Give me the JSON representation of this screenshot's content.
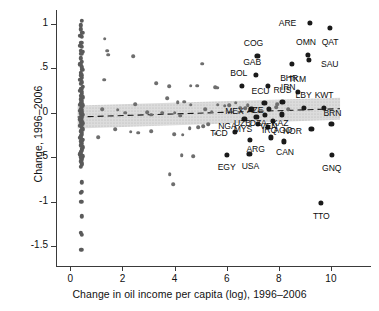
{
  "chart_data": {
    "type": "scatter",
    "title": "",
    "xlabel": "Change in oil income per capita (log), 1996–2006",
    "ylabel": "Change, 1996–2006",
    "xlim": [
      -0.55,
      11.5
    ],
    "ylim": [
      -1.72,
      1.18
    ],
    "xticks": [
      0,
      2,
      4,
      6,
      8,
      10
    ],
    "xticklabels": [
      "0",
      "2",
      "4",
      "6",
      "8",
      "10"
    ],
    "yticks": [
      1,
      0.5,
      0,
      -0.5,
      -1,
      -1.5
    ],
    "yticklabels": [
      "1",
      ".5",
      "0",
      "-.5",
      "-1",
      "-1.5"
    ],
    "grid": false,
    "legend": null,
    "marker_color": "#4d4d4d",
    "label_color": "#0d0d0d",
    "fit_line": {
      "style": "dashed",
      "color": "#1a1a1a",
      "x_start": 0.28,
      "x_end": 10.35,
      "y_start": -0.045,
      "y_end": 0.048
    },
    "confidence_band": {
      "fill": "#d8d8d8",
      "pattern": "dotted",
      "x_start": 0.28,
      "x_end": 10.35,
      "upper_start": 0.085,
      "lower_start": -0.175,
      "upper_end": 0.17,
      "lower_end": -0.075
    },
    "labeled_points": [
      {
        "label": "ARE",
        "x": 9.18,
        "y": 1.015,
        "label_dx": -22,
        "label_dy": 0
      },
      {
        "label": "QAT",
        "x": 9.97,
        "y": 0.955,
        "label_dx": 0,
        "label_dy": 14
      },
      {
        "label": "COG",
        "x": 7.18,
        "y": 0.645,
        "label_dx": -4,
        "label_dy": -13
      },
      {
        "label": "OMN",
        "x": 9.12,
        "y": 0.655,
        "label_dx": -2,
        "label_dy": -13
      },
      {
        "label": "SAU",
        "x": 9.15,
        "y": 0.6,
        "label_dx": 21,
        "label_dy": 4
      },
      {
        "label": "BHR",
        "x": 8.51,
        "y": 0.555,
        "label_dx": -3,
        "label_dy": 14
      },
      {
        "label": "GAB",
        "x": 7.13,
        "y": 0.425,
        "label_dx": -4,
        "label_dy": -13
      },
      {
        "label": "BOL",
        "x": 6.58,
        "y": 0.305,
        "label_dx": -3,
        "label_dy": -13
      },
      {
        "label": "IRN",
        "x": 7.59,
        "y": 0.3,
        "label_dx": 20,
        "label_dy": 1
      },
      {
        "label": "TKM",
        "x": 8.74,
        "y": 0.235,
        "label_dx": -1,
        "label_dy": -13
      },
      {
        "label": "ECU",
        "x": 7.45,
        "y": 0.115,
        "label_dx": -4,
        "label_dy": -12
      },
      {
        "label": "RUS",
        "x": 8.14,
        "y": 0.125,
        "label_dx": 0,
        "label_dy": -12
      },
      {
        "label": "LBY",
        "x": 8.95,
        "y": 0.055,
        "label_dx": 0,
        "label_dy": -13
      },
      {
        "label": "KWT",
        "x": 9.74,
        "y": 0.055,
        "label_dx": 0,
        "label_dy": -13
      },
      {
        "label": "MEX",
        "x": 6.95,
        "y": 0.045,
        "label_dx": -17,
        "label_dy": 2
      },
      {
        "label": "AZE",
        "x": 7.63,
        "y": 0.05,
        "label_dx": -14,
        "label_dy": 1
      },
      {
        "label": "KAZ",
        "x": 8.13,
        "y": -0.015,
        "label_dx": -2,
        "label_dy": 9
      },
      {
        "label": "UZB",
        "x": 7.14,
        "y": -0.04,
        "label_dx": -14,
        "label_dy": 6
      },
      {
        "label": "DZA",
        "x": 7.48,
        "y": -0.025,
        "label_dx": -7,
        "label_dy": 8
      },
      {
        "label": "BRN",
        "x": 10.02,
        "y": -0.12,
        "label_dx": 1,
        "label_dy": -11
      },
      {
        "label": "NGA",
        "x": 6.68,
        "y": -0.07,
        "label_dx": -17,
        "label_dy": 7
      },
      {
        "label": "IRQ",
        "x": 7.76,
        "y": -0.085,
        "label_dx": -3,
        "label_dy": 9
      },
      {
        "label": "MYS",
        "x": 7.2,
        "y": -0.12,
        "label_dx": -15,
        "label_dy": 5
      },
      {
        "label": "AGO",
        "x": 7.58,
        "y": -0.155,
        "label_dx": 15,
        "label_dy": 3
      },
      {
        "label": "NOR",
        "x": 9.25,
        "y": -0.18,
        "label_dx": -19,
        "label_dy": 2
      },
      {
        "label": "TCD",
        "x": 6.32,
        "y": -0.215,
        "label_dx": -16,
        "label_dy": 1
      },
      {
        "label": "ARG",
        "x": 6.88,
        "y": -0.3,
        "label_dx": 6,
        "label_dy": 9
      },
      {
        "label": "VEN",
        "x": 7.69,
        "y": -0.275,
        "label_dx": -2,
        "label_dy": -11
      },
      {
        "label": "CAN",
        "x": 8.2,
        "y": -0.32,
        "label_dx": 1,
        "label_dy": 11
      },
      {
        "label": "EGY",
        "x": 6.0,
        "y": -0.475,
        "label_dx": 0,
        "label_dy": 12
      },
      {
        "label": "USA",
        "x": 6.87,
        "y": -0.46,
        "label_dx": 1,
        "label_dy": 12
      },
      {
        "label": "GNQ",
        "x": 10.03,
        "y": -0.475,
        "label_dx": 0,
        "label_dy": 13
      },
      {
        "label": "TTO",
        "x": 9.63,
        "y": -1.01,
        "label_dx": 0,
        "label_dy": 13
      }
    ],
    "unlabeled_points": [
      {
        "x": 0.44,
        "y": 1.035
      },
      {
        "x": 0.41,
        "y": 0.985
      },
      {
        "x": 0.4,
        "y": 0.94
      },
      {
        "x": 0.46,
        "y": 0.9
      },
      {
        "x": 0.38,
        "y": 0.865
      },
      {
        "x": 0.43,
        "y": 0.855
      },
      {
        "x": 1.32,
        "y": 0.835
      },
      {
        "x": 0.42,
        "y": 0.79
      },
      {
        "x": 0.39,
        "y": 0.755
      },
      {
        "x": 0.45,
        "y": 0.745
      },
      {
        "x": 0.41,
        "y": 0.7
      },
      {
        "x": 0.47,
        "y": 0.685
      },
      {
        "x": 1.41,
        "y": 0.7
      },
      {
        "x": 1.46,
        "y": 0.655
      },
      {
        "x": 0.42,
        "y": 0.665
      },
      {
        "x": 2.42,
        "y": 0.635
      },
      {
        "x": 0.4,
        "y": 0.615
      },
      {
        "x": 0.44,
        "y": 0.575
      },
      {
        "x": 0.38,
        "y": 0.545
      },
      {
        "x": 0.43,
        "y": 0.515
      },
      {
        "x": 5.06,
        "y": 0.555
      },
      {
        "x": 0.46,
        "y": 0.485
      },
      {
        "x": 0.4,
        "y": 0.455
      },
      {
        "x": 1.3,
        "y": 0.375
      },
      {
        "x": 0.42,
        "y": 0.425
      },
      {
        "x": 0.45,
        "y": 0.395
      },
      {
        "x": 0.39,
        "y": 0.375
      },
      {
        "x": 0.44,
        "y": 0.345
      },
      {
        "x": 0.41,
        "y": 0.325
      },
      {
        "x": 3.3,
        "y": 0.335
      },
      {
        "x": 3.8,
        "y": 0.3
      },
      {
        "x": 0.47,
        "y": 0.295
      },
      {
        "x": 0.42,
        "y": 0.275
      },
      {
        "x": 4.62,
        "y": 0.305
      },
      {
        "x": 4.88,
        "y": 0.305
      },
      {
        "x": 0.39,
        "y": 0.25
      },
      {
        "x": 0.45,
        "y": 0.235
      },
      {
        "x": 0.43,
        "y": 0.215
      },
      {
        "x": 5.55,
        "y": 0.29
      },
      {
        "x": 5.63,
        "y": 0.285
      },
      {
        "x": 0.41,
        "y": 0.195
      },
      {
        "x": 0.47,
        "y": 0.175
      },
      {
        "x": 3.72,
        "y": 0.165
      },
      {
        "x": 0.4,
        "y": 0.155
      },
      {
        "x": 0.44,
        "y": 0.135
      },
      {
        "x": 2.48,
        "y": 0.1
      },
      {
        "x": 0.42,
        "y": 0.115
      },
      {
        "x": 0.38,
        "y": 0.095
      },
      {
        "x": 0.46,
        "y": 0.085
      },
      {
        "x": 0.43,
        "y": 0.07
      },
      {
        "x": 4.12,
        "y": 0.12
      },
      {
        "x": 4.36,
        "y": 0.125
      },
      {
        "x": 0.41,
        "y": 0.05
      },
      {
        "x": 0.45,
        "y": 0.035
      },
      {
        "x": 0.39,
        "y": 0.025
      },
      {
        "x": 1.22,
        "y": 0.04
      },
      {
        "x": 1.82,
        "y": 0.035
      },
      {
        "x": 0.44,
        "y": 0.01
      },
      {
        "x": 0.42,
        "y": -0.005
      },
      {
        "x": 0.47,
        "y": -0.02
      },
      {
        "x": 2.1,
        "y": 0.005
      },
      {
        "x": 2.95,
        "y": 0.01
      },
      {
        "x": 3.1,
        "y": -0.02
      },
      {
        "x": 0.4,
        "y": -0.04
      },
      {
        "x": 0.45,
        "y": -0.055
      },
      {
        "x": 0.38,
        "y": -0.07
      },
      {
        "x": 3.52,
        "y": 0.005
      },
      {
        "x": 4.0,
        "y": 0.005
      },
      {
        "x": 4.22,
        "y": -0.03
      },
      {
        "x": 0.43,
        "y": -0.085
      },
      {
        "x": 0.41,
        "y": -0.1
      },
      {
        "x": 4.62,
        "y": 0.095
      },
      {
        "x": 5.18,
        "y": 0.04
      },
      {
        "x": 5.42,
        "y": 0.015
      },
      {
        "x": 5.66,
        "y": 0.095
      },
      {
        "x": 0.46,
        "y": -0.115
      },
      {
        "x": 0.42,
        "y": -0.13
      },
      {
        "x": 0.39,
        "y": -0.145
      },
      {
        "x": 5.92,
        "y": 0.08
      },
      {
        "x": 6.1,
        "y": 0.085
      },
      {
        "x": 6.35,
        "y": 0.115
      },
      {
        "x": 0.44,
        "y": -0.165
      },
      {
        "x": 0.47,
        "y": -0.185
      },
      {
        "x": 0.4,
        "y": -0.205
      },
      {
        "x": 6.52,
        "y": 0.06
      },
      {
        "x": 6.7,
        "y": 0.055
      },
      {
        "x": 6.8,
        "y": 0.09
      },
      {
        "x": 0.43,
        "y": -0.225
      },
      {
        "x": 0.45,
        "y": -0.245
      },
      {
        "x": 0.41,
        "y": -0.26
      },
      {
        "x": 7.9,
        "y": 0.065
      },
      {
        "x": 7.95,
        "y": 0.1
      },
      {
        "x": 8.35,
        "y": 0.045
      },
      {
        "x": 0.38,
        "y": -0.28
      },
      {
        "x": 0.46,
        "y": -0.3
      },
      {
        "x": 0.42,
        "y": -0.32
      },
      {
        "x": 1.08,
        "y": -0.27
      },
      {
        "x": 1.72,
        "y": -0.18
      },
      {
        "x": 2.32,
        "y": -0.21
      },
      {
        "x": 0.44,
        "y": -0.345
      },
      {
        "x": 0.4,
        "y": -0.365
      },
      {
        "x": 0.47,
        "y": -0.385
      },
      {
        "x": 2.6,
        "y": -0.22
      },
      {
        "x": 3.1,
        "y": -0.205
      },
      {
        "x": 3.98,
        "y": -0.24
      },
      {
        "x": 0.43,
        "y": -0.4
      },
      {
        "x": 0.45,
        "y": -0.42
      },
      {
        "x": 0.41,
        "y": -0.44
      },
      {
        "x": 4.32,
        "y": -0.245
      },
      {
        "x": 4.58,
        "y": -0.17
      },
      {
        "x": 4.9,
        "y": -0.16
      },
      {
        "x": 0.39,
        "y": -0.465
      },
      {
        "x": 0.46,
        "y": -0.485
      },
      {
        "x": 0.42,
        "y": -0.5
      },
      {
        "x": 5.1,
        "y": -0.15
      },
      {
        "x": 5.28,
        "y": -0.125
      },
      {
        "x": 5.58,
        "y": -0.235
      },
      {
        "x": 0.44,
        "y": -0.52
      },
      {
        "x": 0.4,
        "y": -0.545
      },
      {
        "x": 0.43,
        "y": -0.565
      },
      {
        "x": 4.28,
        "y": -0.475
      },
      {
        "x": 4.72,
        "y": -0.485
      },
      {
        "x": 3.82,
        "y": -0.69
      },
      {
        "x": 0.45,
        "y": -0.585
      },
      {
        "x": 0.41,
        "y": -0.605
      },
      {
        "x": 3.95,
        "y": -0.8
      },
      {
        "x": 0.43,
        "y": -0.78
      },
      {
        "x": 0.4,
        "y": -0.9
      },
      {
        "x": 0.44,
        "y": -0.885
      },
      {
        "x": 0.42,
        "y": -1.0
      },
      {
        "x": 0.43,
        "y": -1.16
      },
      {
        "x": 0.41,
        "y": -1.345
      },
      {
        "x": 0.45,
        "y": -1.37
      },
      {
        "x": 0.42,
        "y": -1.535
      }
    ]
  }
}
